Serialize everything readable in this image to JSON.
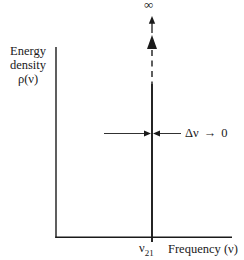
{
  "figure": {
    "background_color": "#ffffff",
    "ink_color": "#1a1a1a",
    "infinity_label": "∞",
    "y_axis_label_lines": [
      "Energy",
      "density",
      "ρ(ν)"
    ],
    "x_axis_label": "Frequency (ν)",
    "x_tick": {
      "base": "ν",
      "subscript": "21"
    },
    "linewidth_annotation": {
      "delta_nu": "Δν",
      "arrow": "→",
      "zero": "0"
    }
  }
}
